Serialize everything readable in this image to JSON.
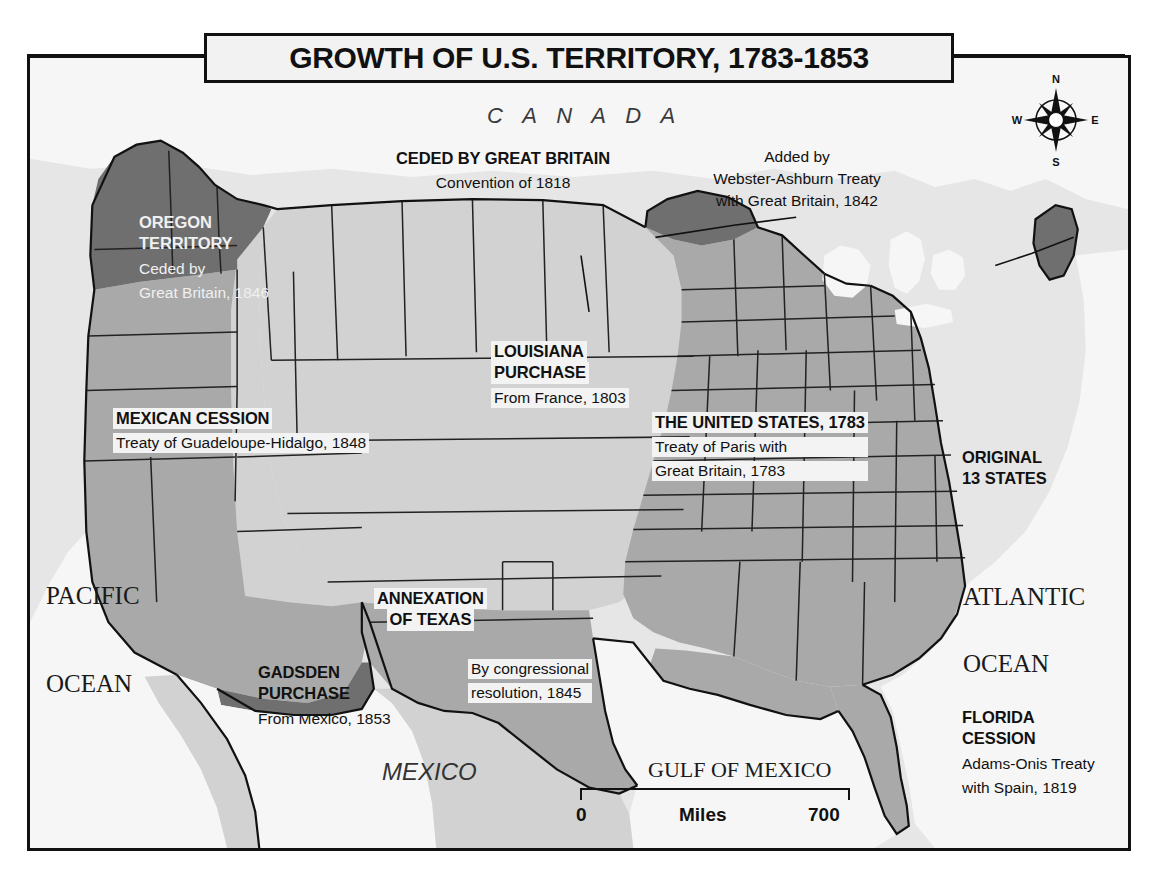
{
  "title": "GROWTH OF U.S. TERRITORY, 1783-1853",
  "regions": {
    "oregon": {
      "heading": "OREGON",
      "heading2": "TERRITORY",
      "sub1": "Ceded by",
      "sub2": "Great Britain, 1846"
    },
    "ceded_britain": {
      "heading": "CEDED BY GREAT BRITAIN",
      "sub": "Convention of 1818"
    },
    "webster": {
      "line1": "Added by",
      "line2": "Webster-Ashburn Treaty",
      "line3": "with Great Britain, 1842"
    },
    "mexican_cession": {
      "heading": "MEXICAN CESSION",
      "sub": "Treaty of Guadeloupe-Hidalgo, 1848"
    },
    "louisiana": {
      "heading": "LOUISIANA",
      "heading2": "PURCHASE",
      "sub": "From France, 1803"
    },
    "united_states": {
      "heading": "THE UNITED STATES, 1783",
      "sub1": "Treaty of Paris with",
      "sub2": "Great Britain, 1783"
    },
    "original13": {
      "heading": "ORIGINAL",
      "heading2": "13 STATES"
    },
    "texas": {
      "heading": "ANNEXATION",
      "heading2": "OF TEXAS",
      "sub1": "By congressional",
      "sub2": "resolution, 1845"
    },
    "gadsden": {
      "heading": "GADSDEN",
      "heading2": "PURCHASE",
      "sub": "From Mexico, 1853"
    },
    "florida": {
      "heading": "FLORIDA",
      "heading2": "CESSION",
      "sub1": "Adams-Onis Treaty",
      "sub2": "with Spain, 1819"
    }
  },
  "geography": {
    "canada": "C A N A D A",
    "mexico": "MEXICO",
    "pacific_1": "PACIFIC",
    "pacific_2": "OCEAN",
    "atlantic_1": "ATLANTIC",
    "atlantic_2": "OCEAN",
    "gulf": "GULF OF MEXICO"
  },
  "compass": {
    "north": "N",
    "south": "S",
    "east": "E",
    "west": "W"
  },
  "scale": {
    "zero": "0",
    "unit": "Miles",
    "max": "700"
  },
  "colors": {
    "water": "#e6e6e6",
    "land_light": "#d2d2d2",
    "land_medium": "#a8a8a8",
    "land_dark": "#6f6f6f",
    "outline": "#111111",
    "label_bg": "#f3f3f3"
  }
}
